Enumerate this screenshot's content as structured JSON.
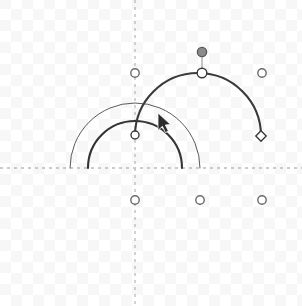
{
  "app": {
    "surface_name": "arc-editor-canvas",
    "width": 302,
    "height": 306,
    "background_color": "#ffffff",
    "checker_color": "#f6f6f6"
  },
  "axes": {
    "color": "#b9b9c4",
    "dash": "3 4",
    "stroke_width": 1.3,
    "horizontal": {
      "name": "x-axis",
      "y": 168,
      "x1": 0,
      "x2": 302
    },
    "vertical": {
      "name": "y-axis",
      "x": 135,
      "y1": 0,
      "y2": 306
    }
  },
  "cursor": {
    "name": "arrow-pointer",
    "x": 158,
    "y": 113,
    "color": "#2b2b2b"
  },
  "chart_data": {
    "type": "scatter",
    "title": "",
    "xlabel": "",
    "ylabel": "",
    "xlim": [
      0,
      302
    ],
    "ylim": [
      306,
      0
    ],
    "grid": false,
    "legend": false,
    "arcs": [
      {
        "name": "arc-outer-thin",
        "center_x": 135,
        "center_y": 168,
        "radius": 65,
        "start_angle_deg": 180,
        "end_angle_deg": 0,
        "stroke": "#5a5a5a",
        "stroke_width": 1.0,
        "selected": false
      },
      {
        "name": "arc-inner-thick",
        "center_x": 135,
        "center_y": 168,
        "radius": 47,
        "start_angle_deg": 180,
        "end_angle_deg": 0,
        "stroke": "#343434",
        "stroke_width": 2.1,
        "selected": false
      },
      {
        "name": "arc-selected-large",
        "center_x": 198,
        "center_y": 136,
        "radius": 63,
        "start_angle_deg": 180,
        "end_angle_deg": 0,
        "stroke": "#3a3a3a",
        "stroke_width": 2.1,
        "selected": true
      }
    ],
    "handles": [
      {
        "name": "handle-arc-start-point",
        "x": 135,
        "y": 135,
        "shape": "circle",
        "r": 4.0,
        "fill": "#ffffff",
        "stroke": "#3a3a3a",
        "state": "anchor"
      },
      {
        "name": "handle-arc-apex",
        "x": 202,
        "y": 73,
        "shape": "circle",
        "r": 4.8,
        "fill": "#ffffff",
        "stroke": "#3a3a3a",
        "state": "anchor"
      },
      {
        "name": "handle-arc-radius-drag",
        "x": 202,
        "y": 52,
        "shape": "circle",
        "r": 4.6,
        "fill": "#8c8c8c",
        "stroke": "#5a5a5a",
        "state": "active"
      },
      {
        "name": "handle-arc-end-point",
        "x": 261,
        "y": 136,
        "shape": "diamond",
        "r": 4.6,
        "fill": "#ffffff",
        "stroke": "#3a3a3a",
        "state": "anchor"
      },
      {
        "name": "handle-grid-top-left",
        "x": 135,
        "y": 73,
        "shape": "circle",
        "r": 4.2,
        "fill": "#ffffff",
        "stroke": "#6a6a6a",
        "state": "snap"
      },
      {
        "name": "handle-grid-top-right",
        "x": 262,
        "y": 73,
        "shape": "circle",
        "r": 4.2,
        "fill": "#ffffff",
        "stroke": "#6a6a6a",
        "state": "snap"
      },
      {
        "name": "handle-grid-bottom-left",
        "x": 135,
        "y": 200,
        "shape": "circle",
        "r": 4.2,
        "fill": "#ffffff",
        "stroke": "#6a6a6a",
        "state": "snap"
      },
      {
        "name": "handle-grid-bottom-mid",
        "x": 200,
        "y": 200,
        "shape": "circle",
        "r": 4.2,
        "fill": "#ffffff",
        "stroke": "#6a6a6a",
        "state": "snap"
      },
      {
        "name": "handle-grid-bottom-right",
        "x": 262,
        "y": 200,
        "shape": "circle",
        "r": 4.2,
        "fill": "#ffffff",
        "stroke": "#6a6a6a",
        "state": "snap"
      }
    ],
    "leader_lines": [
      {
        "name": "leader-apex-to-radius-handle",
        "x1": 202,
        "y1": 73,
        "x2": 202,
        "y2": 52,
        "stroke": "#8c8c8c",
        "stroke_width": 1.0
      }
    ]
  }
}
